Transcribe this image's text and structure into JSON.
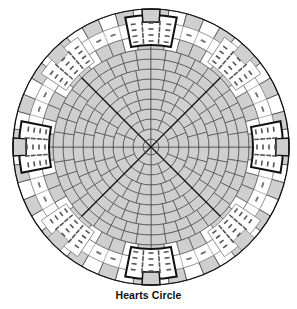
{
  "caption": "Hearts Circle",
  "diagram": {
    "type": "quilt-pattern",
    "center": [
      151,
      147
    ],
    "outer_radius": 138,
    "colors": {
      "fill_gray": "#cfcfcf",
      "fill_light": "#ffffff",
      "line": "#3a3a3a",
      "line_dark": "#111111",
      "dash": "#555555"
    },
    "rings": [
      {
        "r": 8,
        "segments": 4
      },
      {
        "r": 18,
        "segments": 8
      },
      {
        "r": 28,
        "segments": 16
      },
      {
        "r": 38,
        "segments": 16
      },
      {
        "r": 48,
        "segments": 24
      },
      {
        "r": 58,
        "segments": 24
      },
      {
        "r": 68,
        "segments": 32
      },
      {
        "r": 78,
        "segments": 32
      },
      {
        "r": 88,
        "segments": 40
      },
      {
        "r": 98,
        "segments": 40
      }
    ],
    "border": {
      "inner_r": 98,
      "outer_r": 138,
      "segments": 48
    },
    "diagonals": [
      45,
      135
    ],
    "hearts": {
      "count": 8,
      "bold_angles_deg": [
        270,
        202.5,
        337.5,
        45,
        135
      ],
      "angles_deg": [
        270,
        315,
        0,
        45,
        90,
        135,
        180,
        225
      ]
    }
  }
}
